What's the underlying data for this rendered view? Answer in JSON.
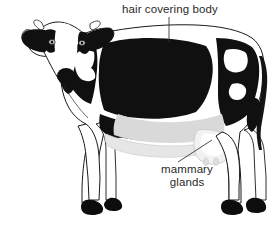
{
  "figure": {
    "background_color": "#ffffff",
    "coat_black": "#101010",
    "coat_white": "#ffffff",
    "belly_shading": "#d9d9d9",
    "outline_color": "#1a1a1a",
    "hoof_color": "#0d0d0d"
  },
  "labels": {
    "hair": {
      "text": "hair covering body",
      "color": "#2b2b2b",
      "leader": "vertical line down to the back"
    },
    "mammary": {
      "line1": "mammary",
      "line2": "glands",
      "color": "#2b2b2b",
      "leader": "diagonal line up-right to the udder"
    }
  }
}
